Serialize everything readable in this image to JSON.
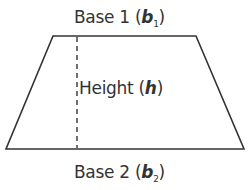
{
  "diagram": {
    "shape": {
      "type": "trapezoid",
      "vertices": {
        "top_left": [
          53,
          36
        ],
        "top_right": [
          196,
          36
        ],
        "bottom_right": [
          244,
          149
        ],
        "bottom_left": [
          6,
          149
        ]
      },
      "stroke_color": "#333333",
      "fill_color": "#ffffff"
    },
    "height_line": {
      "style": "dashed",
      "x": 77,
      "y_top": 36,
      "y_bottom": 149,
      "color": "#333333"
    },
    "labels": {
      "base1": {
        "text": "Base 1 (",
        "variable": "b",
        "subscript": "1",
        "close": ")"
      },
      "base2": {
        "text": "Base 2 (",
        "variable": "b",
        "subscript": "2",
        "close": ")"
      },
      "height": {
        "text": "Height (",
        "variable": "h",
        "close": ")"
      }
    }
  }
}
